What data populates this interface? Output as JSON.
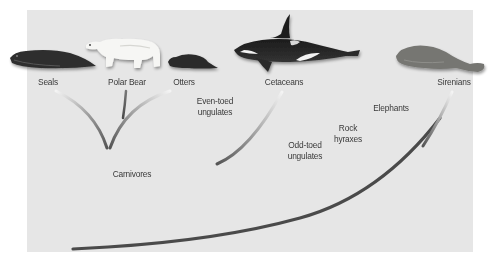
{
  "diagram": {
    "type": "phylogenetic-tree",
    "colors": {
      "panel_background": "#e6e6e6",
      "branch_dark": "#4a4a4a",
      "branch_light": "#f4f4f4",
      "label_text": "#3a3a3a"
    },
    "animals": [
      {
        "id": "seal",
        "label": "Seals",
        "icon": "seal-illustration"
      },
      {
        "id": "polar-bear",
        "label": "Polar Bear",
        "icon": "polar-bear-illustration"
      },
      {
        "id": "otter",
        "label": "Otters",
        "icon": "otter-illustration"
      },
      {
        "id": "orca",
        "label": "Cetaceans",
        "icon": "orca-illustration"
      },
      {
        "id": "manatee",
        "label": "Sirenians",
        "icon": "manatee-illustration"
      }
    ],
    "clade_labels": {
      "carnivores": "Carnivores",
      "even_toed_line1": "Even-toed",
      "even_toed_line2": "ungulates",
      "odd_toed_line1": "Odd-toed",
      "odd_toed_line2": "ungulates",
      "rock_line1": "Rock",
      "rock_line2": "hyraxes",
      "elephants": "Elephants"
    }
  }
}
